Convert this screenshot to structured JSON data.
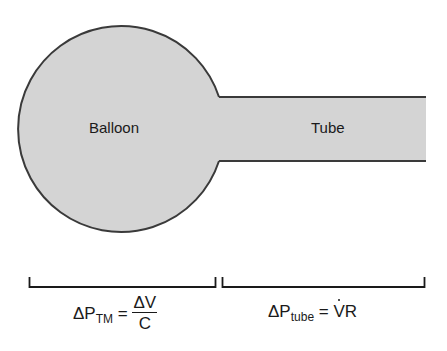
{
  "diagram": {
    "type": "balloon-and-tube respiratory model",
    "colors": {
      "fill": "#d4d4d4",
      "stroke": "#3a3a3a",
      "text": "#1a1a1a",
      "background": "#ffffff"
    },
    "shapes": {
      "balloon": {
        "label": "Balloon"
      },
      "tube": {
        "label": "Tube"
      }
    },
    "brackets": [
      {
        "id": "balloon-bracket",
        "spans": "Balloon"
      },
      {
        "id": "tube-bracket",
        "spans": "Tube"
      }
    ],
    "equations": {
      "transmural": {
        "lhs_symbol": "ΔP",
        "lhs_subscript": "TM",
        "equals": "=",
        "numerator": "ΔV",
        "denominator": "C",
        "full_text": "ΔP_TM = ΔV / C"
      },
      "tube": {
        "lhs_symbol": "ΔP",
        "lhs_subscript": "tube",
        "equals": "=",
        "rhs_flow": "V",
        "rhs_flow_note": "V with overdot (flow)",
        "rhs_resistance": "R",
        "full_text": "ΔP_tube = V̇R"
      }
    }
  }
}
